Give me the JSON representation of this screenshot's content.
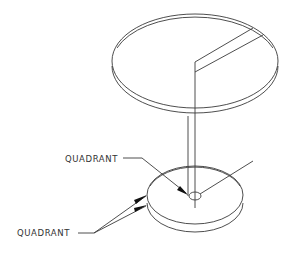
{
  "figure": {
    "type": "isometric technical drawing",
    "line_color": "#3a3a3a",
    "background": "#ffffff"
  },
  "labels": {
    "upper_label": "QUADRANT",
    "lower_label": "QUADRANT"
  },
  "parts": {
    "upper_disk": {
      "name": "upper disk",
      "has_slot": true
    },
    "lower_disk": {
      "name": "lower disk",
      "has_center_hole": true
    },
    "connector": {
      "name": "vertical axis lines"
    }
  }
}
